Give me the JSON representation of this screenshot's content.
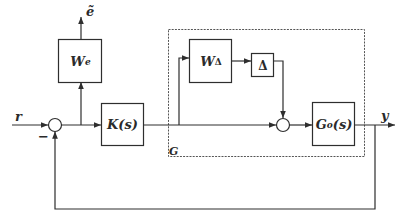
{
  "diagram": {
    "type": "feedback-control-block-diagram",
    "colors": {
      "line": "#2e2e2e",
      "background": "#ffffff",
      "dashed": "#555555"
    },
    "signals": {
      "reference": "r",
      "error_weighted": "ẽ",
      "output": "y",
      "feedback_sign": "−"
    },
    "blocks": {
      "error_weight": {
        "base": "W",
        "sub": "e"
      },
      "controller": {
        "label": "K(s)"
      },
      "uncertainty_weight": {
        "base": "W",
        "sub": "Δ"
      },
      "uncertainty": {
        "label": "Δ"
      },
      "nominal_plant": {
        "base": "G",
        "sub": "o",
        "arg": "(s)"
      }
    },
    "plant_group": {
      "label": "G"
    }
  }
}
